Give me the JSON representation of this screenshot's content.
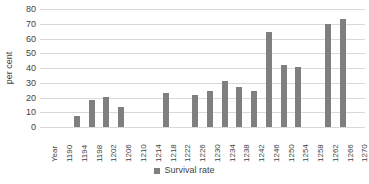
{
  "chart_data": {
    "type": "bar",
    "title": "",
    "xlabel": "",
    "ylabel": "per cent",
    "ylim": [
      0,
      80
    ],
    "ytick_step": 10,
    "yticks": [
      80,
      70,
      60,
      50,
      40,
      30,
      20,
      10,
      0
    ],
    "grid": true,
    "legend_position": "bottom",
    "legend": [
      "Survival rate"
    ],
    "series_name": "Survival rate",
    "bar_color": "#7f7f7f",
    "grid_color": "#d9d9d9",
    "text_color": "#3f3f3f",
    "categories": [
      "Year",
      "1190",
      "1194",
      "1198",
      "1202",
      "1206",
      "1210",
      "1214",
      "1218",
      "1222",
      "1226",
      "1230",
      "1234",
      "1238",
      "1242",
      "1246",
      "1250",
      "1254",
      "1258",
      "1262",
      "1266",
      "1270"
    ],
    "values": [
      null,
      null,
      7.5,
      18.5,
      20.5,
      13.5,
      null,
      null,
      23,
      null,
      22,
      24.5,
      31.5,
      27,
      24.5,
      64.5,
      42,
      40.5,
      null,
      70,
      73,
      null
    ],
    "points": [
      {
        "category": "Year",
        "value": null
      },
      {
        "category": "1190",
        "value": null
      },
      {
        "category": "1194",
        "value": 7.5
      },
      {
        "category": "1198",
        "value": 18.5
      },
      {
        "category": "1202",
        "value": 20.5
      },
      {
        "category": "1206",
        "value": 13.5
      },
      {
        "category": "1210",
        "value": null
      },
      {
        "category": "1214",
        "value": null
      },
      {
        "category": "1218",
        "value": 23
      },
      {
        "category": "1222",
        "value": null
      },
      {
        "category": "1226",
        "value": 22
      },
      {
        "category": "1230",
        "value": 24.5
      },
      {
        "category": "1234",
        "value": 31.5
      },
      {
        "category": "1238",
        "value": 27
      },
      {
        "category": "1242",
        "value": 24.5
      },
      {
        "category": "1246",
        "value": 64.5
      },
      {
        "category": "1250",
        "value": 42
      },
      {
        "category": "1254",
        "value": 40.5
      },
      {
        "category": "1258",
        "value": null
      },
      {
        "category": "1262",
        "value": 70
      },
      {
        "category": "1266",
        "value": 73
      },
      {
        "category": "1270",
        "value": null
      }
    ]
  }
}
